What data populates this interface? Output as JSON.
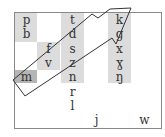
{
  "diagram": {
    "type": "consonant-chart-with-arrow",
    "columns": {
      "labial": [
        "p",
        "b",
        "m"
      ],
      "labiodental": [
        "f",
        "v"
      ],
      "alveolar": [
        "t",
        "d",
        "s",
        "z",
        "n",
        "r",
        "l"
      ],
      "velar": [
        "k",
        "g",
        "x",
        "ɣ",
        "ŋ"
      ],
      "approximants": [
        "j",
        "w"
      ]
    },
    "glyphs": {
      "p": "p",
      "b": "b",
      "m": "m",
      "f": "f",
      "v": "v",
      "t": "t",
      "d": "d",
      "s": "s",
      "z": "z",
      "n": "n",
      "r": "r",
      "l": "l",
      "k": "k",
      "g": "g",
      "x": "x",
      "gamma": "ɣ",
      "eng": "ŋ",
      "j": "j",
      "w": "w"
    },
    "colors": {
      "shade": "#dcdcdc",
      "shade_dark": "#b5b5b5",
      "frame": "#8a8a8a",
      "arrow_stroke": "#333333"
    }
  }
}
